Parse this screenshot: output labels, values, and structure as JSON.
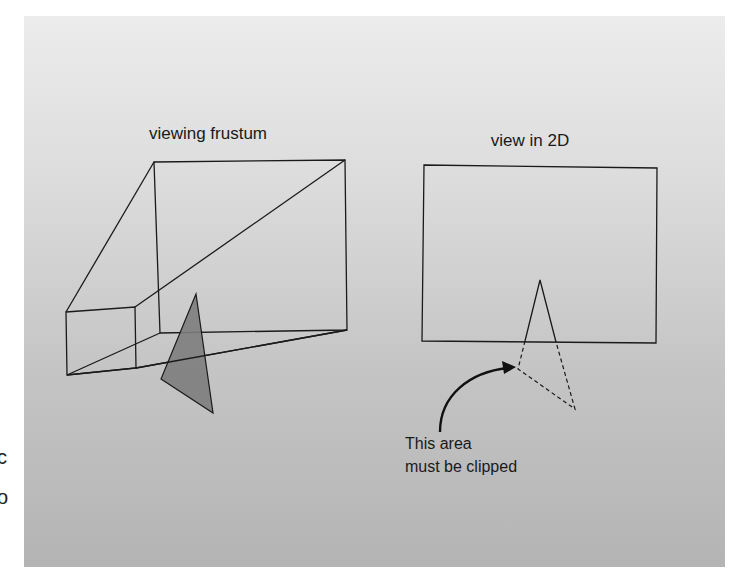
{
  "figure": {
    "left_panel": {
      "title": "viewing frustum"
    },
    "right_panel": {
      "title": "view in 2D",
      "annotation_line1": "This area",
      "annotation_line2": "must be clipped"
    },
    "margin_fragments": [
      "c",
      "o"
    ],
    "colors": {
      "line": "#1a1a1a",
      "triangle_fill": "#7d7d7d",
      "panel_top": "#ececec",
      "panel_bottom": "#b4b4b4"
    }
  }
}
